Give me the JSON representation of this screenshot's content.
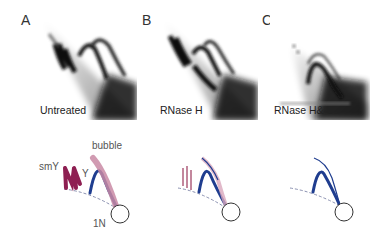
{
  "figure": {
    "panels": [
      {
        "letter": "A",
        "label": "Untreated"
      },
      {
        "letter": "B",
        "label": "RNase H"
      },
      {
        "letter": "C",
        "label": "RNase H& S1"
      }
    ],
    "cartoon_labels": {
      "smY": "smY",
      "bubble": "bubble",
      "y_arc": "Y",
      "one_n": "1N"
    },
    "colors": {
      "y_arc": "#1f3d8f",
      "smY": "#8e1f52",
      "bubble": "#c98aa5",
      "dashed": "#8a90b0",
      "circle": "#333333"
    }
  }
}
